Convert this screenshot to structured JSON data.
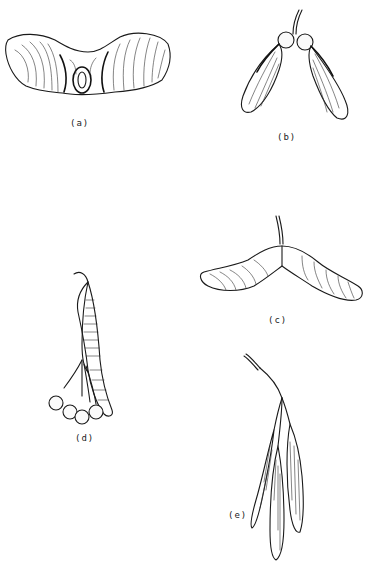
{
  "figures": [
    {
      "id": "a",
      "label": "(a)"
    },
    {
      "id": "b",
      "label": "(b)"
    },
    {
      "id": "c",
      "label": "(c)"
    },
    {
      "id": "d",
      "label": "(d)"
    },
    {
      "id": "e",
      "label": "(e)"
    }
  ],
  "colors": {
    "ink": "#1a1a1a",
    "background": "#ffffff"
  }
}
